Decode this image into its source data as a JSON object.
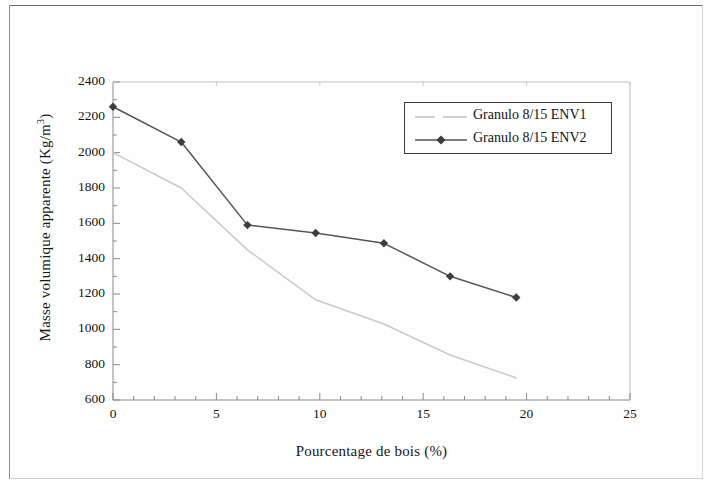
{
  "figure": {
    "caption_visible": false,
    "frame": "scanned-page-border"
  },
  "chart_data": {
    "type": "line",
    "title": "",
    "xlabel": "Pourcentage de bois (%)",
    "ylabel": "Masse volumique apparente (Kg/m3)",
    "ylabel_display": "Masse volumique apparente (Kg/m",
    "ylabel_sup": "3",
    "ylabel_tail": ")",
    "xlim": [
      0,
      25
    ],
    "ylim": [
      600,
      2400
    ],
    "xticks": [
      0,
      5,
      10,
      15,
      20,
      25
    ],
    "yticks": [
      600,
      800,
      1000,
      1200,
      1400,
      1600,
      1800,
      2000,
      2200,
      2400
    ],
    "xtick_labels": [
      "0",
      "5",
      "10",
      "15",
      "20",
      "25"
    ],
    "ytick_labels": [
      "600",
      "800",
      "1000",
      "1200",
      "1400",
      "1600",
      "1800",
      "2000",
      "2200",
      "2400"
    ],
    "x_minor_tick_interval": 1,
    "y_minor_tick_interval": 100,
    "grid": false,
    "legend_position": "upper right",
    "series": [
      {
        "name": "Granulo 8/15 ENV1",
        "color": "#c9c9c9",
        "marker": "none",
        "linestyle": "solid-light",
        "x": [
          0.0,
          3.3,
          6.5,
          9.8,
          13.1,
          16.3,
          19.5
        ],
        "y": [
          2000,
          1800,
          1450,
          1167,
          1030,
          855,
          725
        ]
      },
      {
        "name": "Granulo 8/15 ENV2",
        "color": "#555555",
        "marker": "diamond",
        "linestyle": "solid",
        "x": [
          0.0,
          3.3,
          6.5,
          9.8,
          13.1,
          16.3,
          19.5
        ],
        "y": [
          2260,
          2060,
          1590,
          1545,
          1487,
          1300,
          1180
        ]
      }
    ]
  }
}
